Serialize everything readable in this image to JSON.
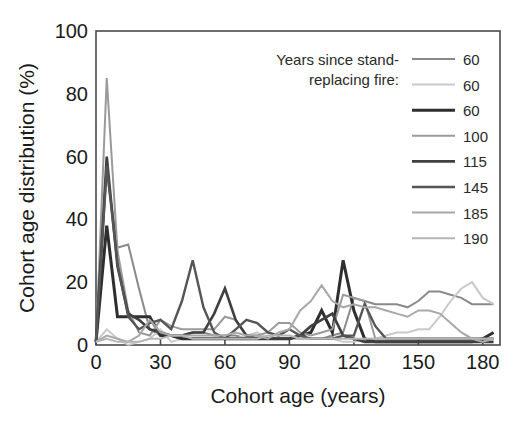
{
  "chart_data": {
    "type": "line",
    "title": "",
    "xlabel": "Cohort age (years)",
    "ylabel": "Cohort age distribution (%)",
    "xlim": [
      0,
      188
    ],
    "ylim": [
      0,
      100
    ],
    "xticks": [
      0,
      30,
      60,
      90,
      120,
      150,
      180
    ],
    "yticks": [
      0,
      20,
      40,
      60,
      80,
      100
    ],
    "xtick_labels": [
      "0",
      "30",
      "60",
      "90",
      "120",
      "150",
      "180"
    ],
    "ytick_labels": [
      "0",
      "20",
      "40",
      "60",
      "80",
      "100"
    ],
    "grid": false,
    "legend_position": "top-right",
    "legend_title": "Years since stand-replacing fire:",
    "legend_title_line1": "Years since stand-",
    "legend_title_line2": "replacing fire:",
    "series": [
      {
        "name": "60",
        "label": "60",
        "color": "#8a8a8a",
        "width": 2.0,
        "x": [
          0,
          5,
          10,
          15,
          20,
          25,
          30,
          35,
          40,
          45,
          50,
          55,
          60,
          65,
          70,
          75,
          80,
          85,
          90,
          95,
          100,
          105,
          110,
          115,
          120,
          125,
          130,
          135,
          140,
          145,
          150,
          155,
          160,
          165,
          170,
          175,
          180,
          185
        ],
        "y": [
          1,
          55,
          31,
          32,
          18,
          5,
          3,
          3,
          3,
          4,
          4,
          3,
          3,
          3,
          2,
          2,
          2,
          2,
          2,
          2,
          2,
          2,
          3,
          4,
          15,
          14,
          13,
          13,
          13,
          12,
          14,
          17,
          17,
          16,
          15,
          13,
          13,
          13
        ]
      },
      {
        "name": "60",
        "label": "60",
        "color": "#c9c9c9",
        "width": 2.0,
        "x": [
          0,
          5,
          10,
          15,
          20,
          25,
          30,
          35,
          40,
          45,
          50,
          55,
          60,
          65,
          70,
          75,
          80,
          85,
          90,
          95,
          100,
          105,
          110,
          115,
          120,
          125,
          130,
          135,
          140,
          145,
          150,
          155,
          160,
          165,
          170,
          175,
          180,
          185
        ],
        "y": [
          1,
          5,
          2,
          0,
          1,
          2,
          5,
          1,
          2,
          2,
          2,
          2,
          2,
          2,
          3,
          4,
          2,
          2,
          2,
          2,
          2,
          2,
          2,
          1,
          1,
          2,
          2,
          3,
          4,
          4,
          5,
          5,
          9,
          14,
          18,
          20,
          15,
          13
        ]
      },
      {
        "name": "60",
        "label": "60",
        "color": "#2e2e2e",
        "width": 3.0,
        "x": [
          0,
          5,
          10,
          15,
          20,
          25,
          30,
          35,
          40,
          45,
          50,
          55,
          60,
          65,
          70,
          75,
          80,
          85,
          90,
          95,
          100,
          105,
          110,
          115,
          120,
          125,
          130,
          135,
          140,
          145,
          150,
          155,
          160,
          165,
          170,
          175,
          180,
          185
        ],
        "y": [
          1,
          38,
          9,
          9,
          9,
          9,
          3,
          3,
          2,
          2,
          2,
          2,
          2,
          2,
          2,
          2,
          2,
          2,
          2,
          3,
          4,
          11,
          4,
          27,
          11,
          2,
          1,
          1,
          1,
          1,
          1,
          1,
          1,
          1,
          1,
          1,
          2,
          4
        ]
      },
      {
        "name": "100",
        "label": "100",
        "color": "#9a9a9a",
        "width": 2.0,
        "x": [
          0,
          5,
          10,
          15,
          20,
          25,
          30,
          35,
          40,
          45,
          50,
          55,
          60,
          65,
          70,
          75,
          80,
          85,
          90,
          95,
          100,
          105,
          110,
          115,
          120,
          125,
          130,
          135,
          140,
          145,
          150,
          155,
          160,
          165,
          170,
          175,
          180,
          185
        ],
        "y": [
          1,
          85,
          30,
          11,
          4,
          3,
          8,
          6,
          5,
          5,
          5,
          5,
          9,
          8,
          3,
          3,
          4,
          7,
          7,
          4,
          3,
          4,
          5,
          16,
          15,
          14,
          2,
          2,
          2,
          2,
          2,
          2,
          2,
          2,
          2,
          2,
          2,
          2
        ]
      },
      {
        "name": "115",
        "label": "115",
        "color": "#3f3f3f",
        "width": 2.6,
        "x": [
          0,
          5,
          10,
          15,
          20,
          25,
          30,
          35,
          40,
          45,
          50,
          55,
          60,
          65,
          70,
          75,
          80,
          85,
          90,
          95,
          100,
          105,
          110,
          115,
          120,
          125,
          130,
          135,
          140,
          145,
          150,
          155,
          160,
          165,
          170,
          175,
          180,
          185
        ],
        "y": [
          1,
          60,
          25,
          10,
          8,
          5,
          4,
          3,
          3,
          4,
          4,
          10,
          18,
          8,
          3,
          2,
          2,
          2,
          2,
          3,
          6,
          8,
          10,
          3,
          2,
          1,
          1,
          1,
          1,
          1,
          1,
          1,
          1,
          1,
          1,
          1,
          1,
          1
        ]
      },
      {
        "name": "145",
        "label": "145",
        "color": "#555555",
        "width": 2.4,
        "x": [
          0,
          5,
          10,
          15,
          20,
          25,
          30,
          35,
          40,
          45,
          50,
          55,
          60,
          65,
          70,
          75,
          80,
          85,
          90,
          95,
          100,
          105,
          110,
          115,
          120,
          125,
          130,
          135,
          140,
          145,
          150,
          155,
          160,
          165,
          170,
          175,
          180,
          185
        ],
        "y": [
          1,
          57,
          26,
          9,
          5,
          7,
          8,
          5,
          14,
          27,
          12,
          4,
          2,
          5,
          8,
          7,
          4,
          3,
          5,
          3,
          2,
          2,
          2,
          3,
          3,
          13,
          6,
          2,
          2,
          2,
          2,
          2,
          2,
          2,
          2,
          2,
          2,
          2
        ]
      },
      {
        "name": "185",
        "label": "185",
        "color": "#a8a8a8",
        "width": 2.0,
        "x": [
          0,
          5,
          10,
          15,
          20,
          25,
          30,
          35,
          40,
          45,
          50,
          55,
          60,
          65,
          70,
          75,
          80,
          85,
          90,
          95,
          100,
          105,
          110,
          115,
          120,
          125,
          130,
          135,
          140,
          145,
          150,
          155,
          160,
          165,
          170,
          175,
          180,
          185
        ],
        "y": [
          1,
          3,
          2,
          1,
          3,
          8,
          4,
          3,
          3,
          3,
          3,
          3,
          3,
          4,
          3,
          3,
          2,
          4,
          5,
          11,
          14,
          19,
          14,
          12,
          13,
          12,
          12,
          11,
          10,
          9,
          11,
          11,
          10,
          7,
          4,
          2,
          1,
          2
        ]
      },
      {
        "name": "190",
        "label": "190",
        "color": "#b5b5b5",
        "width": 2.0,
        "x": [
          0,
          5,
          10,
          15,
          20,
          25,
          30,
          35,
          40,
          45,
          50,
          55,
          60,
          65,
          70,
          75,
          80,
          85,
          90,
          95,
          100,
          105,
          110,
          115,
          120,
          125,
          130,
          135,
          140,
          145,
          150,
          155,
          160,
          165,
          170,
          175,
          180,
          185
        ],
        "y": [
          1,
          2,
          1,
          1,
          1,
          2,
          2,
          3,
          3,
          2,
          2,
          2,
          2,
          2,
          2,
          2,
          3,
          3,
          3,
          2,
          2,
          2,
          2,
          2,
          2,
          2,
          2,
          2,
          2,
          2,
          2,
          2,
          2,
          2,
          2,
          2,
          2,
          2
        ]
      }
    ]
  }
}
